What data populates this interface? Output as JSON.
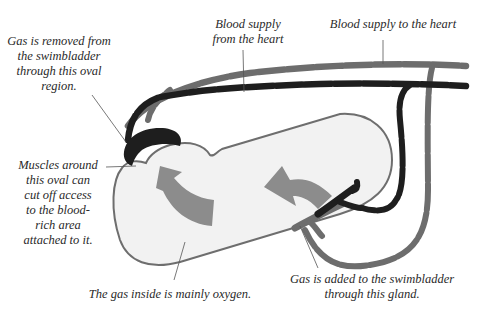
{
  "diagram": {
    "colors": {
      "background": "#ffffff",
      "bladder_fill": "#f2f2f2",
      "bladder_stroke": "#6e6e6e",
      "vessel_to_heart": "#6d6d6d",
      "vessel_from_heart": "#1e1e1e",
      "arrow_fill": "#8c8c8c",
      "leader_line": "#555555",
      "text": "#2a2a2a"
    },
    "labels": {
      "oval_removal": [
        "Gas is removed from",
        "the swimbladder",
        "through this oval",
        "region."
      ],
      "from_heart": [
        "Blood supply",
        "from the heart"
      ],
      "to_heart": [
        "Blood supply to the heart"
      ],
      "muscles": [
        "Muscles around",
        "this oval can",
        "cut off access",
        "to the blood-",
        "rich area",
        "attached to it."
      ],
      "gas_inside": [
        "The gas inside is mainly oxygen."
      ],
      "gland": [
        "Gas is added to the swimbladder",
        "through this gland."
      ]
    },
    "icons": {
      "flow_arrow_left": "curved-arrow-icon",
      "flow_arrow_right": "curved-arrow-icon"
    }
  }
}
